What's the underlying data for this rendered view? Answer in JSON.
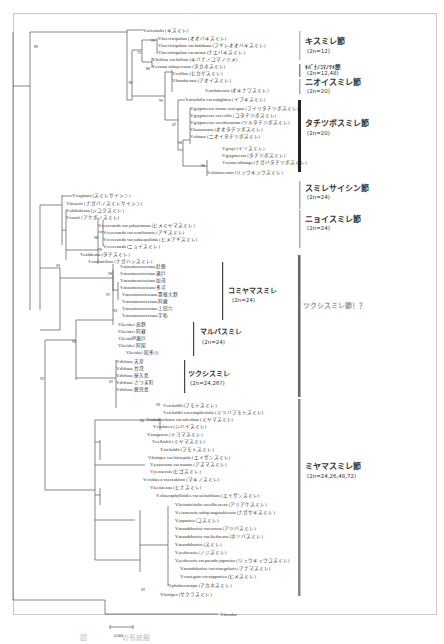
{
  "figure": {
    "scale_bar_label": "0.000",
    "outgroup": "V.bicolor",
    "sections": [
      {
        "name": "キスミレ節",
        "chromosome": "(2n=12)",
        "bar_color": "#bbbbbb"
      },
      {
        "name": "ｷﾊﾞﾅﾉｺﾏﾉﾂﾒ節",
        "chromosome": "(2n=12,48)",
        "bar_color": "#888888"
      },
      {
        "name": "ニオイスミレ節",
        "chromosome": "(2n=20)",
        "bar_color": "#aaaaaa"
      },
      {
        "name": "タチツボスミレ節",
        "chromosome": "(2n=20)",
        "bar_color": "#222222"
      },
      {
        "name": "スミレサイシン節",
        "chromosome": "(2n=24)",
        "bar_color": "#aaaaaa"
      },
      {
        "name": "ニョイスミレ節",
        "chromosome": "(2n=24)",
        "bar_color": "#aaaaaa"
      },
      {
        "name": "ツクシスミレ節！？",
        "chromosome": "",
        "bar_color": "#666666"
      },
      {
        "name": "ミヤマスミレ節",
        "chromosome": "(2n=24,26,48,72)",
        "bar_color": "#888888"
      }
    ],
    "groups": [
      {
        "name": "コミヤマスミレ",
        "chromosome": "(2n=24)"
      },
      {
        "name": "マルバスミレ",
        "chromosome": "(2n=24)"
      },
      {
        "name": "ツクシスミレ",
        "chromosome": "(2n=24,26?)"
      }
    ],
    "leaves": [
      "V.orientalis (キスミレ)",
      "V.brevistipulata (オオバキスミレ)",
      "V.brevistipulata var.hidakana (フギレオオバキスミレ)",
      "V.brevistipulata var.minor (ナエバキスミレ)",
      "V.biflora var.biflora (キバナノコマノツメ)",
      "V.crassa subsp.crassa (タカネスミレ)",
      "V.collina (ヒカゲスミレ)",
      "V.hondoensis (アオイスミレ)",
      "V.utchinensis (オキナワスミレ)",
      "V.mirabilis var.subglabra (イブキスミレ)",
      "V.grypoceras forma variegata (フイリタチツボスミレ)",
      "V.grypoceras var.exilis (コタチツボスミレ)",
      "V.grypoceras var.rhizomata (ツルタチツボスミレ)",
      "V.kusanoana (オオタチツボスミレ)",
      "V.ovato-oblonga (ナガバタチツボスミレ)",
      "V.grayi (イソスミレ)",
      "V.grypoceras (タチツボスミレ)",
      "V.obtusa (ニオイタチツボスミレ)",
      "V.okinawensis (リュウキュウスミレ)",
      "V.vaginata (スミレサイシン)",
      "V.bissetii (ナガバノスミレサイシン)",
      "V.shikokiana (シコクスミレ)",
      "V.rossii (アケボノスミレ)",
      "V.verecunda var.yakusimana (ヒメミヤマスミレ)",
      "V.verecunda var.semilunaris (アギスミレ)",
      "V.verecunda var.subaequiloba (ヒメアギスミレ)",
      "V.verecunda (ニョイスミレ)",
      "V.raddeana (タチスミレ)",
      "V.stoloniflora (ナガハシスミレ)",
      "V.maximowicziana 鈴鹿",
      "V.maximowicziana 瀬戸",
      "V.maximowicziana 加茂",
      "V.maximowicziana 多可",
      "V.maximowicziana 豊根大野",
      "V.maximowicziana 阿蘇",
      "V.maximowicziana 上田穴",
      "V.maximowicziana 宇和",
      "V.keiskei 高野",
      "V.keiskei 阿蘇",
      "V.keiskei 瀬戸",
      "V.keiskei 阿知",
      "V.keiskei 知多川",
      "V.diffusa 天草",
      "V.diffusa 台湾",
      "V.diffusa 屋久島",
      "V.diffusa さつま町",
      "V.diffusa 鹿児島",
      "V.sieboldii (フモトスミレ)",
      "V.sieboldii var.simplicifolia (ミツバフモトスミレ)",
      "V.tokubuchiana var.takedana (ミヤマスミレ)",
      "V.violacea (シハイスミレ)",
      "V.inagawae (トヨマスミレ)",
      "V.selkirkii (ミヤマスミレ)",
      "V.sieboldii (フモトスミレ)",
      "V.hirtipes var.latisepala (エイザンスミレ)",
      "V.yazawana var.asuana (アズマスミレ)",
      "V.yezoensis (ヒゴスミレ)",
      "V.violacea var.makinoi (マキノスミレ)",
      "V.keiskeana (ヒナスミレ)",
      "V.chaerophylloides var.sieboldiana (エイザンスミレ)",
      "V.betonicifolia var.albescens (アリアケスミレ)",
      "V.eizanensis subsp.nagasakiensis (ナガサキスミレ)",
      "V.japonica (コスミレ)",
      "V.mandshurica var.crassa (アツバスミレ)",
      "V.mandshurica var.ikedaeana (ホソバスミレ)",
      "V.mandshurica (スミレ)",
      "V.yedoensis (ノジスミレ)",
      "V.yedoensis var.pseudo-japonica (リュウキュウコスミレ)",
      "V.mandshurica var.triangularis (アナマスミレ)",
      "V.variegata var.nipponica (ヒメスミレ)",
      "V.phalacrocarpa (アカネスミレ)",
      "V.hirtipes (サクラスミレ)"
    ],
    "bootstrap_values": [
      "89",
      "75",
      "78",
      "99",
      "86",
      "99",
      "47",
      "98",
      "96",
      "98",
      "99",
      "93",
      "98",
      "97",
      "93",
      "93",
      "94",
      "92",
      "92",
      "93",
      "95",
      "92"
    ]
  },
  "caption": "図　　　　　の系統樹　　　　　　"
}
